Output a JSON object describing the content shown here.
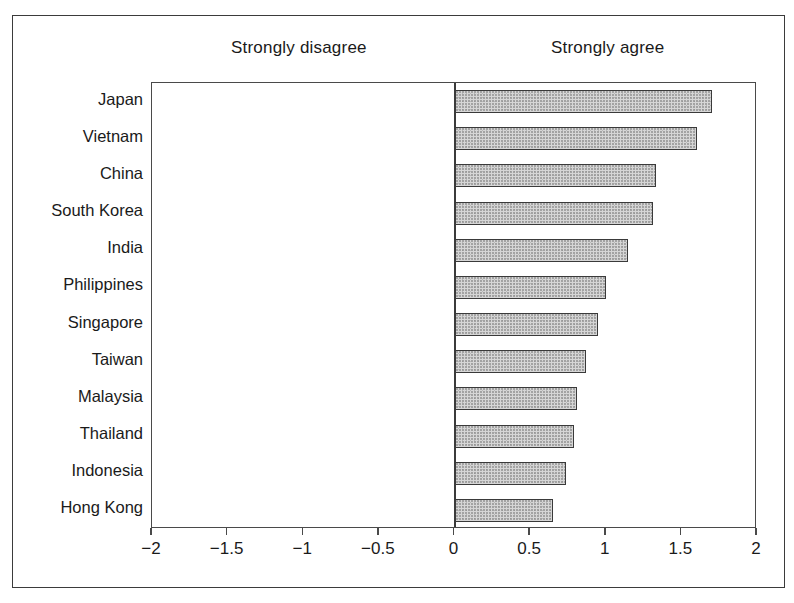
{
  "chart_data": {
    "type": "bar",
    "orientation": "horizontal",
    "title": "",
    "subtitle": "",
    "xlabel": "",
    "ylabel": "",
    "xlim": [
      -2,
      2
    ],
    "grid": false,
    "legend": null,
    "axis_annotations": {
      "left": "Strongly disagree",
      "right": "Strongly agree"
    },
    "xticks": [
      -2,
      -1.5,
      -1,
      -0.5,
      0,
      0.5,
      1,
      1.5,
      2
    ],
    "xticklabels": [
      "-2",
      "-1.5",
      "-1",
      "-0.5",
      "0",
      "0.5",
      "1",
      "1.5",
      "2"
    ],
    "categories": [
      "Japan",
      "Vietnam",
      "China",
      "South Korea",
      "India",
      "Philippines",
      "Singapore",
      "Taiwan",
      "Malaysia",
      "Thailand",
      "Indonesia",
      "Hong Kong"
    ],
    "values": [
      1.7,
      1.6,
      1.33,
      1.31,
      1.15,
      1.0,
      0.95,
      0.87,
      0.81,
      0.79,
      0.74,
      0.65
    ],
    "series": [
      {
        "name": "Mean response",
        "values": [
          1.7,
          1.6,
          1.33,
          1.31,
          1.15,
          1.0,
          0.95,
          0.87,
          0.81,
          0.79,
          0.74,
          0.65
        ]
      }
    ]
  },
  "style": {
    "bar_fill": "#d6d6d6",
    "bar_border": "#3a3a3a",
    "frame_color": "#4a4a4a",
    "outer_frame_color": "#3b3b3b",
    "text_color": "#1a1a1a",
    "background": "#ffffff"
  }
}
